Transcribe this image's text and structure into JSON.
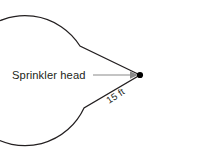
{
  "figure": {
    "type": "geometry-sector-diagram",
    "background_color": "#ffffff",
    "stroke_color": "#231f20",
    "leader_color": "#8a8a8a",
    "center_dot_color": "#000000",
    "labels": {
      "sprinkler_head": "Sprinkler head",
      "radius": "15 ft"
    },
    "geometry": {
      "center_x": 140,
      "center_y": 75,
      "radius_px": 65,
      "arc_start_x": 80,
      "arc_start_y": 46,
      "arc_end_x": 84,
      "arc_end_y": 108,
      "radius_label_rotation_deg": -33,
      "leader_start_x": 93,
      "leader_end_x": 131,
      "leader_y": 75
    }
  }
}
